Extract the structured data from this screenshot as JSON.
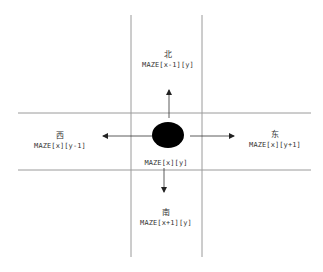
{
  "diagram": {
    "title": "",
    "center": {
      "expr": "MAZE[x][y]"
    },
    "north": {
      "direction": "北",
      "expr": "MAZE[x-1][y]"
    },
    "south": {
      "direction": "南",
      "expr": "MAZE[x+1][y]"
    },
    "west": {
      "direction": "西",
      "expr": "MAZE[x][y-1]"
    },
    "east": {
      "direction": "东",
      "expr": "MAZE[x][y+1]"
    },
    "colors": {
      "line": "#9a9a9a",
      "arrow": "#333333",
      "node": "#000000",
      "background": "#ffffff"
    }
  }
}
